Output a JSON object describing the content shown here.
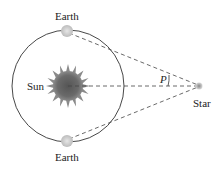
{
  "diagram": {
    "labels": {
      "earth_top": "Earth",
      "earth_bottom": "Earth",
      "sun": "Sun",
      "star": "Star",
      "parallax_angle": "P"
    },
    "nodes": [
      {
        "id": "sun",
        "label": "Sun",
        "x": 68,
        "y": 86
      },
      {
        "id": "earth_top",
        "label": "Earth",
        "x": 67,
        "y": 31
      },
      {
        "id": "earth_bottom",
        "label": "Earth",
        "x": 67,
        "y": 141
      },
      {
        "id": "star",
        "label": "Star",
        "x": 199,
        "y": 86
      }
    ],
    "edges": [
      {
        "from": "earth_top",
        "to": "star",
        "style": "dashed"
      },
      {
        "from": "earth_bottom",
        "to": "star",
        "style": "dashed"
      },
      {
        "from": "sun",
        "to": "star",
        "style": "dashed"
      }
    ],
    "orbit": {
      "center_x": 68,
      "center_y": 86,
      "radius": 56
    },
    "colors": {
      "line": "#333333",
      "sun": "#666666",
      "earth": "#c8c8c8",
      "star": "#999999"
    }
  }
}
